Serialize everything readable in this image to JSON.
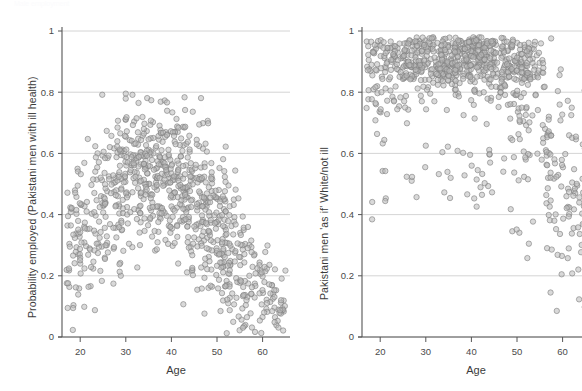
{
  "top_cut_text": "Male employment",
  "panels": [
    {
      "id": "left",
      "ylabel": "Probability employed (Pakistani men with ill health)",
      "xlabel": "Age",
      "y_ticks": [
        "0",
        "0.2",
        "0.4",
        "0.6",
        "0.8",
        "1"
      ],
      "x_ticks": [
        "20",
        "30",
        "40",
        "50",
        "60"
      ]
    },
    {
      "id": "right",
      "ylabel": "Pakistani men 'as if' White/not ill",
      "xlabel": "Age",
      "y_ticks": [
        "0",
        "0.2",
        "0.4",
        "0.6",
        "0.8",
        "1"
      ],
      "x_ticks": [
        "20",
        "30",
        "40",
        "50",
        "60"
      ]
    }
  ],
  "chart_data": [
    {
      "type": "scatter",
      "panel": "left",
      "title": "",
      "xlabel": "Age",
      "ylabel": "Probability employed (Pakistani men with ill health)",
      "xlim": [
        16,
        66
      ],
      "ylim": [
        0,
        1
      ],
      "xticks": [
        20,
        30,
        40,
        50,
        60
      ],
      "yticks": [
        0,
        0.2,
        0.4,
        0.6,
        0.8,
        1
      ],
      "grid": "horizontal",
      "legend": "none",
      "marker": {
        "shape": "circle",
        "size_px": 5.4,
        "fill": "#b9b9b9",
        "fill_opacity": 0.55,
        "edge": "#7d7d7d"
      },
      "n_points": 900,
      "description": "Predicted employment probability vs age; inverted-U shape peaking near age 35-40 around 0.6-0.8 then declining steeply after 50 toward 0.0-0.2",
      "profile_x": [
        18,
        22,
        26,
        30,
        34,
        38,
        42,
        46,
        50,
        54,
        58,
        62,
        65
      ],
      "profile_mean_y": [
        0.3,
        0.37,
        0.45,
        0.52,
        0.55,
        0.54,
        0.5,
        0.44,
        0.35,
        0.25,
        0.17,
        0.11,
        0.08
      ],
      "profile_spread_y": [
        0.2,
        0.22,
        0.22,
        0.21,
        0.2,
        0.2,
        0.2,
        0.21,
        0.21,
        0.2,
        0.16,
        0.11,
        0.08
      ],
      "observed_ymax": 0.8,
      "observed_ymin": 0.01
    },
    {
      "type": "scatter",
      "panel": "right",
      "title": "",
      "xlabel": "Age",
      "ylabel": "Pakistani men 'as if' White/not ill",
      "xlim": [
        16,
        66
      ],
      "ylim": [
        0,
        1
      ],
      "xticks": [
        20,
        30,
        40,
        50,
        60
      ],
      "yticks": [
        0,
        0.2,
        0.4,
        0.6,
        0.8,
        1
      ],
      "grid": "horizontal",
      "legend": "none",
      "marker": {
        "shape": "circle",
        "size_px": 5.4,
        "fill": "#b9b9b9",
        "fill_opacity": 0.55,
        "edge": "#7d7d7d"
      },
      "n_points": 900,
      "description": "Counterfactual employment probability vs age; dense mass at 0.85-0.97 across ages 20-52, thinner tail down to 0.3-0.6, steep drop after age 55 reaching 0.05-0.5",
      "profile_x": [
        18,
        22,
        26,
        30,
        34,
        38,
        42,
        46,
        50,
        54,
        58,
        62,
        65
      ],
      "profile_mean_y": [
        0.76,
        0.83,
        0.87,
        0.89,
        0.9,
        0.9,
        0.89,
        0.87,
        0.82,
        0.7,
        0.56,
        0.48,
        0.45
      ],
      "profile_spread_y": [
        0.14,
        0.13,
        0.12,
        0.11,
        0.1,
        0.1,
        0.11,
        0.12,
        0.15,
        0.2,
        0.24,
        0.22,
        0.2
      ],
      "observed_ymax": 0.98,
      "observed_ymin": 0.05
    }
  ]
}
